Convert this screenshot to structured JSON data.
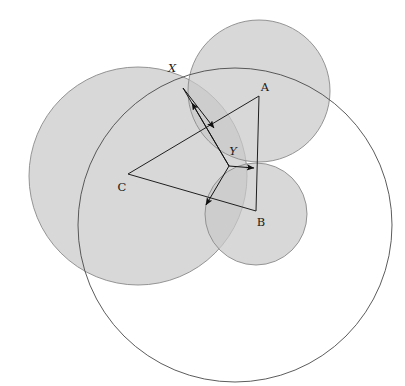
{
  "figure": {
    "kind": "geometry-diagram",
    "background": "#ffffff",
    "width": 405,
    "height": 386,
    "stroke_color": "#4a4a4a",
    "disk_fill": "#c9c9c9",
    "disk_fill_opacity": 0.72,
    "disk_stroke": "#8a8a8a",
    "label_color": "#1a1a1a"
  },
  "labels": {
    "A": "A",
    "B": "B",
    "C": "C",
    "X": "X",
    "Y": "Y"
  },
  "points": {
    "A": {
      "name": "A",
      "x": 259,
      "y": 96
    },
    "B": {
      "name": "B",
      "x": 256,
      "y": 211
    },
    "C": {
      "name": "C",
      "x": 128,
      "y": 174
    },
    "X": {
      "name": "X",
      "x": 183,
      "y": 88
    },
    "Y": {
      "name": "Y",
      "x": 229,
      "y": 166
    }
  },
  "label_positions": {
    "A": {
      "x": 265,
      "y": 91
    },
    "B": {
      "x": 261,
      "y": 226
    },
    "C": {
      "x": 122,
      "y": 191
    },
    "X": {
      "x": 172,
      "y": 72
    },
    "Y": {
      "x": 233,
      "y": 155
    }
  },
  "disks": [
    {
      "name": "disk-C",
      "cx": 138,
      "cy": 176,
      "r": 109,
      "filled": true
    },
    {
      "name": "disk-A",
      "cx": 259,
      "cy": 91,
      "r": 71,
      "filled": true
    },
    {
      "name": "disk-B",
      "cx": 256,
      "cy": 214,
      "r": 51,
      "filled": true
    }
  ],
  "outline_circle": {
    "name": "big-circle",
    "cx": 235,
    "cy": 225,
    "r": 157,
    "filled": false
  },
  "triangle": {
    "name": "triangle-ABC",
    "vertices": [
      "A",
      "B",
      "C"
    ],
    "edges": [
      {
        "from": "A",
        "to": "B"
      },
      {
        "from": "B",
        "to": "C"
      },
      {
        "from": "C",
        "to": "A"
      }
    ]
  },
  "segments": [
    {
      "name": "segment-XY",
      "x1": 183,
      "y1": 88,
      "x2": 229,
      "y2": 166
    }
  ],
  "arrows": [
    {
      "name": "arrow-Y-to-X",
      "x1": 229,
      "y1": 166,
      "x2": 192,
      "y2": 103,
      "head": "end"
    },
    {
      "name": "arrow-X-to-Y",
      "x1": 183,
      "y1": 88,
      "x2": 214,
      "y2": 128,
      "head": "end"
    },
    {
      "name": "arrow-Y-right",
      "x1": 229,
      "y1": 166,
      "x2": 254,
      "y2": 168,
      "head": "end"
    },
    {
      "name": "arrow-Y-lower-left",
      "x1": 229,
      "y1": 166,
      "x2": 206,
      "y2": 205,
      "head": "end"
    }
  ]
}
